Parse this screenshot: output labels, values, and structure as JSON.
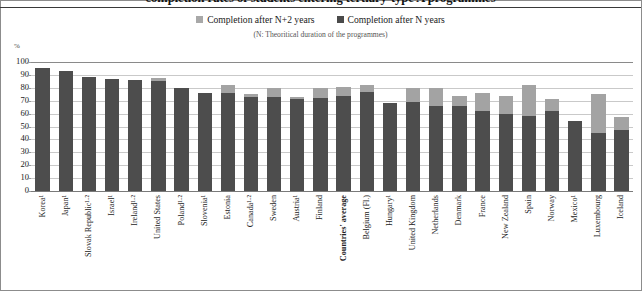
{
  "header": {
    "title_partial": "completion rates of students entering tertiary-type A programmes",
    "rule": "title-divider"
  },
  "legend": {
    "position": "top-center",
    "items": [
      {
        "label": "Completion after N+2 years",
        "color": "#a3a3a3",
        "swatch": "light-square-icon"
      },
      {
        "label": "Completion after N years",
        "color": "#4d4d4d",
        "swatch": "dark-square-icon"
      }
    ]
  },
  "subtitle": "(N: Theoritical duration of the programmes)",
  "axis": {
    "y_unit": "%",
    "y_ticks": [
      "100",
      "90",
      "80",
      "70",
      "60",
      "50",
      "40",
      "30",
      "20",
      "10",
      "0"
    ]
  },
  "chart_data": {
    "type": "bar",
    "stacked": true,
    "title": "completion rates of students entering tertiary-type A programmes",
    "subtitle": "(N: Theoritical duration of the programmes)",
    "xlabel": "",
    "ylabel": "%",
    "ylim": [
      0,
      100
    ],
    "ytick_step": 10,
    "grid": true,
    "legend_position": "top-center",
    "categories": [
      "Korea¹",
      "Japan¹",
      "Slovak Republic¹·²",
      "Israel¹",
      "Ireland¹·²",
      "United States",
      "Poland¹·²",
      "Slovenia¹",
      "Estonia",
      "Canada¹·²",
      "Sweden",
      "Austria¹",
      "Finland",
      "Countries' average",
      "Belgium (Fl.)",
      "Hungary¹",
      "United Kingdom",
      "Netherlands",
      "Denmark",
      "France",
      "New Zealand",
      "Spain",
      "Norway",
      "Mexico¹",
      "Luxembourg",
      "Iceland"
    ],
    "series": [
      {
        "name": "Completion after N years",
        "color": "#4d4d4d",
        "values": [
          95,
          93,
          88,
          87,
          86,
          85,
          80,
          76,
          76,
          73,
          73,
          71,
          72,
          74,
          77,
          68,
          69,
          66,
          66,
          62,
          60,
          58,
          62,
          54,
          45,
          47
        ]
      },
      {
        "name": "Completion after N+2 years",
        "color": "#a3a3a3",
        "values": [
          0,
          0,
          0,
          0,
          0,
          3,
          0,
          0,
          6,
          2,
          7,
          2,
          8,
          7,
          5,
          0,
          11,
          14,
          8,
          14,
          14,
          24,
          9,
          0,
          30,
          10
        ]
      }
    ],
    "totals": [
      95,
      93,
      88,
      87,
      86,
      88,
      80,
      76,
      82,
      75,
      80,
      73,
      80,
      81,
      82,
      68,
      80,
      80,
      74,
      76,
      74,
      82,
      71,
      54,
      75,
      57
    ],
    "highlighted_category": "Countries' average"
  }
}
